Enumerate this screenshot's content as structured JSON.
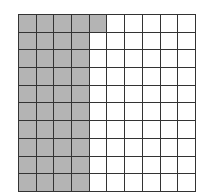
{
  "diagram": {
    "type": "hundred-grid",
    "columns": 10,
    "rows": 10,
    "shaded_count": 41,
    "shaded_cells_description": "First 4 columns of every row plus column 5 of row 1",
    "colors": {
      "shaded": "#b4b4b4",
      "empty": "#ffffff",
      "line": "#333333"
    }
  }
}
